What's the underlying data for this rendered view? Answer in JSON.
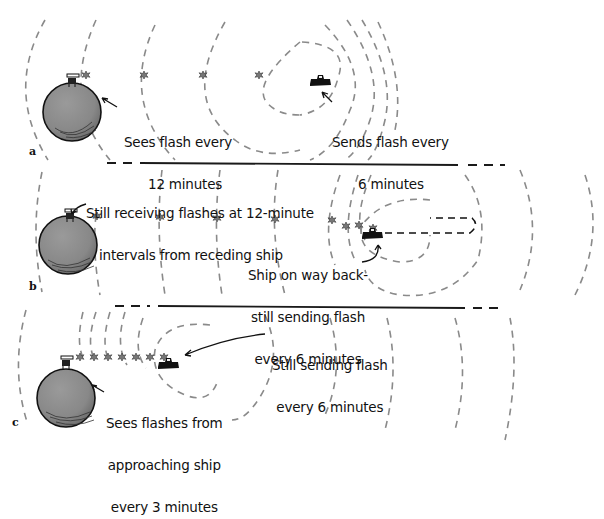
{
  "figure": {
    "panels": [
      {
        "id": "a",
        "letter": "a",
        "observer_caption_line1": "Sees flash every",
        "observer_caption_line2": "12 minutes",
        "ship_caption_line1": "Sends flash every",
        "ship_caption_line2": "6 minutes",
        "ship_motion": "receding",
        "flash_count": 5
      },
      {
        "id": "b",
        "letter": "b",
        "observer_caption_line1": "Still receiving flashes at 12-minute",
        "observer_caption_line2": "intervals from receding ship",
        "ship_caption_line1": "Ship on way back-",
        "ship_caption_line2": "still sending flash",
        "ship_caption_line3": "every 6 minutes",
        "ship_motion": "turning back",
        "flash_count": 7
      },
      {
        "id": "c",
        "letter": "c",
        "observer_caption_line1": "Sees flashes from",
        "observer_caption_line2": "approaching ship",
        "observer_caption_line3": "every 3 minutes",
        "ship_caption_line1": "Still sending flash",
        "ship_caption_line2": "every 6 minutes",
        "ship_motion": "approaching",
        "flash_count": 7
      }
    ],
    "icons": {
      "planet": "planet-icon",
      "observer": "telescope-observer-icon",
      "ship": "spaceship-icon",
      "flash": "flash-burst-icon"
    },
    "colors": {
      "planet_fill": "#8c8c8c",
      "wavefront": "#8a8a8a",
      "ink": "#111111",
      "background": "#ffffff"
    }
  }
}
